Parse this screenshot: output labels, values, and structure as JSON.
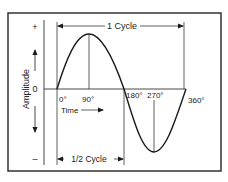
{
  "diagram": {
    "y_axis_label": "Amplitude",
    "y_marks": {
      "plus": "+",
      "zero": "0",
      "minus": "–"
    },
    "angle_labels": [
      "0°",
      "90°",
      "180°",
      "270°",
      "360°"
    ],
    "time_label": "Time",
    "full_cycle_label": "1 Cycle",
    "half_cycle_label": "1/2 Cycle",
    "colors": {
      "line": "#1a1a1a",
      "background": "#ffffff",
      "frame": "#333333"
    }
  }
}
